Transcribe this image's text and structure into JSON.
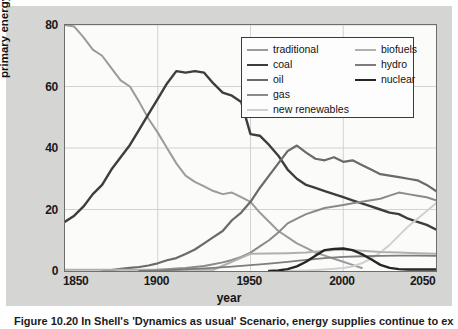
{
  "figure": {
    "caption": "Figure 10.20  In Shell's 'Dynamics as usual' Scenario, energy supplies continue to expand",
    "background_color": "#d5d5d3",
    "plot_background_color": "#fbfbfa"
  },
  "chart_data": {
    "type": "line",
    "title": "",
    "xlabel": "year",
    "ylabel": "primary energy share/%",
    "xlim": [
      1850,
      2050
    ],
    "ylim": [
      0,
      80
    ],
    "xticks": [
      1850,
      1900,
      1950,
      2000,
      2050
    ],
    "yticks": [
      0,
      20,
      40,
      60,
      80
    ],
    "grid": true,
    "legend_position": "upper-right-inside",
    "legend_columns": 2,
    "series": [
      {
        "name": "traditional",
        "color": "#9b9b9b",
        "width": 2.0,
        "x": [
          1850,
          1855,
          1860,
          1865,
          1870,
          1875,
          1880,
          1885,
          1890,
          1895,
          1900,
          1905,
          1910,
          1915,
          1920,
          1925,
          1930,
          1935,
          1940,
          1945,
          1950,
          1955,
          1960,
          1965,
          1970,
          1975,
          1980,
          1985,
          1990,
          1995,
          2000,
          2005,
          2010
        ],
        "values": [
          80.0,
          79.5,
          76.0,
          72.0,
          70.0,
          66.0,
          62.0,
          60.0,
          55.0,
          49.5,
          45.0,
          40.0,
          35.0,
          31.0,
          29.0,
          27.5,
          26.0,
          25.0,
          25.5,
          24.0,
          22.5,
          19.0,
          16.0,
          13.0,
          11.0,
          9.0,
          7.5,
          6.0,
          5.0,
          4.0,
          3.0,
          2.0,
          1.0
        ]
      },
      {
        "name": "coal",
        "color": "#3d3d3d",
        "width": 2.4,
        "x": [
          1850,
          1855,
          1860,
          1865,
          1870,
          1875,
          1880,
          1885,
          1890,
          1895,
          1900,
          1905,
          1910,
          1915,
          1920,
          1925,
          1930,
          1935,
          1940,
          1945,
          1950,
          1955,
          1960,
          1965,
          1970,
          1975,
          1980,
          1985,
          1990,
          1995,
          2000,
          2005,
          2010,
          2015,
          2020,
          2025,
          2030,
          2035,
          2040,
          2045,
          2050
        ],
        "values": [
          16.0,
          18.0,
          21.0,
          25.0,
          28.0,
          33.0,
          37.0,
          41.0,
          46.0,
          51.0,
          56.0,
          61.0,
          65.0,
          64.5,
          65.0,
          64.5,
          61.0,
          58.0,
          57.0,
          55.0,
          44.5,
          44.0,
          41.0,
          37.5,
          33.0,
          30.0,
          28.0,
          27.0,
          26.0,
          25.0,
          24.0,
          23.0,
          22.0,
          21.0,
          20.0,
          19.0,
          18.5,
          17.0,
          16.0,
          15.0,
          13.5
        ]
      },
      {
        "name": "oil",
        "color": "#6a6a6a",
        "width": 2.2,
        "x": [
          1870,
          1875,
          1880,
          1885,
          1890,
          1895,
          1900,
          1905,
          1910,
          1915,
          1920,
          1925,
          1930,
          1935,
          1940,
          1945,
          1950,
          1955,
          1960,
          1965,
          1970,
          1975,
          1980,
          1985,
          1990,
          1995,
          2000,
          2005,
          2010,
          2015,
          2020,
          2025,
          2030,
          2035,
          2040,
          2045,
          2050
        ],
        "values": [
          0.0,
          0.3,
          0.7,
          1.0,
          1.3,
          1.8,
          2.5,
          3.5,
          4.2,
          5.5,
          7.0,
          9.0,
          11.0,
          13.0,
          16.5,
          19.0,
          22.5,
          27.0,
          31.0,
          35.0,
          39.0,
          40.8,
          38.5,
          36.5,
          36.0,
          37.0,
          35.5,
          36.0,
          34.5,
          33.0,
          31.5,
          31.0,
          30.5,
          30.0,
          29.5,
          28.0,
          26.0
        ]
      },
      {
        "name": "gas",
        "color": "#8a8a8a",
        "width": 2.0,
        "x": [
          1890,
          1895,
          1900,
          1905,
          1910,
          1915,
          1920,
          1925,
          1930,
          1935,
          1940,
          1945,
          1950,
          1955,
          1960,
          1965,
          1970,
          1975,
          1980,
          1985,
          1990,
          1995,
          2000,
          2005,
          2010,
          2015,
          2020,
          2025,
          2030,
          2035,
          2040,
          2045,
          2050
        ],
        "values": [
          0.0,
          0.2,
          0.4,
          0.6,
          0.8,
          1.0,
          1.3,
          1.6,
          2.2,
          2.8,
          3.6,
          4.6,
          6.0,
          8.0,
          10.0,
          12.5,
          15.5,
          17.0,
          18.5,
          19.5,
          20.5,
          21.0,
          21.5,
          22.0,
          22.5,
          23.0,
          23.5,
          24.5,
          25.5,
          25.0,
          24.5,
          24.0,
          23.0
        ]
      },
      {
        "name": "new renewables",
        "color": "#d0d0d0",
        "width": 2.0,
        "x": [
          1970,
          1975,
          1980,
          1985,
          1990,
          1995,
          2000,
          2005,
          2010,
          2015,
          2020,
          2025,
          2030,
          2035,
          2040,
          2045,
          2050
        ],
        "values": [
          0.0,
          0.1,
          0.2,
          0.3,
          0.5,
          0.7,
          1.0,
          1.5,
          2.5,
          4.0,
          6.0,
          8.5,
          11.5,
          14.5,
          17.0,
          19.5,
          22.0
        ]
      },
      {
        "name": "biofuels",
        "color": "#b0b0b0",
        "width": 2.0,
        "x": [
          1850,
          1900,
          1930,
          1950,
          1960,
          1970,
          1980,
          1990,
          2000,
          2010,
          2020,
          2030,
          2040,
          2050
        ],
        "values": [
          0.4,
          0.4,
          0.4,
          5.6,
          5.7,
          5.8,
          6.0,
          6.6,
          7.0,
          6.6,
          6.2,
          6.0,
          5.8,
          5.6
        ]
      },
      {
        "name": "hydro",
        "color": "#7c7c7c",
        "width": 1.8,
        "x": [
          1890,
          1900,
          1910,
          1920,
          1930,
          1940,
          1950,
          1960,
          1970,
          1980,
          1990,
          2000,
          2010,
          2020,
          2030,
          2040,
          2050
        ],
        "values": [
          0.0,
          0.2,
          0.4,
          0.7,
          1.0,
          1.4,
          1.9,
          2.4,
          3.0,
          3.6,
          4.2,
          4.6,
          4.8,
          4.9,
          5.0,
          5.0,
          4.9
        ]
      },
      {
        "name": "nuclear",
        "color": "#262626",
        "width": 2.4,
        "x": [
          1960,
          1965,
          1970,
          1975,
          1980,
          1985,
          1990,
          1995,
          2000,
          2005,
          2010,
          2015,
          2020,
          2025,
          2030,
          2035,
          2040,
          2045,
          2050
        ],
        "values": [
          0.0,
          0.2,
          0.6,
          1.5,
          3.0,
          5.0,
          6.8,
          7.2,
          7.3,
          6.8,
          5.5,
          3.8,
          2.0,
          1.0,
          0.6,
          0.5,
          0.5,
          0.5,
          0.5
        ]
      }
    ]
  },
  "axes": {
    "ylabel": "primary energy share/%",
    "xlabel": "year",
    "yticks": [
      "0",
      "20",
      "40",
      "60",
      "80"
    ],
    "xticks": [
      "1850",
      "1900",
      "1950",
      "2000",
      "2050"
    ]
  },
  "legend": {
    "column_left": [
      {
        "label": "traditional",
        "color": "#9b9b9b",
        "width": 2.0
      },
      {
        "label": "coal",
        "color": "#3d3d3d",
        "width": 2.6
      },
      {
        "label": "oil",
        "color": "#6a6a6a",
        "width": 2.2
      },
      {
        "label": "gas",
        "color": "#8a8a8a",
        "width": 2.0
      },
      {
        "label": "new renewables",
        "color": "#d0d0d0",
        "width": 2.0
      }
    ],
    "column_right": [
      {
        "label": "biofuels",
        "color": "#b0b0b0",
        "width": 2.0
      },
      {
        "label": "hydro",
        "color": "#7c7c7c",
        "width": 2.0
      },
      {
        "label": "nuclear",
        "color": "#262626",
        "width": 2.6
      }
    ]
  }
}
